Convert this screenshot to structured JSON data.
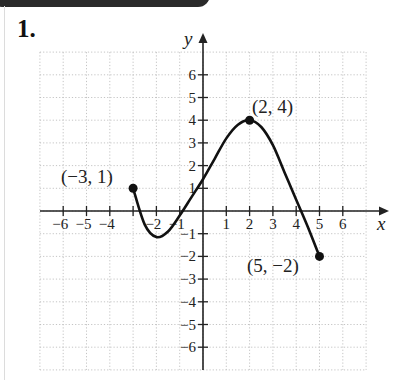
{
  "header": {
    "problem_number": "1."
  },
  "chart_data": {
    "type": "line",
    "title": "",
    "xlabel": "x",
    "ylabel": "y",
    "xlim": [
      -7,
      7
    ],
    "ylim": [
      -7,
      7
    ],
    "grid": true,
    "x_ticks": [
      -6,
      -5,
      -4,
      -3,
      -2,
      -1,
      1,
      2,
      3,
      4,
      5,
      6
    ],
    "x_tick_labels": [
      "−6",
      "−5",
      "−4",
      "",
      "−2",
      "−1",
      "1",
      "2",
      "3",
      "4",
      "5",
      "6"
    ],
    "y_ticks": [
      6,
      5,
      4,
      3,
      2,
      1,
      -1,
      -2,
      -3,
      -4,
      -5,
      -6
    ],
    "y_tick_labels": [
      "6",
      "5",
      "4",
      "3",
      "2",
      "1",
      "−1",
      "−2",
      "−3",
      "−4",
      "−5",
      "−6"
    ],
    "series": [
      {
        "name": "f(x)",
        "x": [
          -3,
          -2.5,
          -2,
          -1.5,
          -1,
          -0.5,
          0,
          0.5,
          1,
          1.5,
          2,
          2.5,
          3,
          3.5,
          4,
          4.5,
          5
        ],
        "y": [
          1,
          -0.6,
          -1.15,
          -0.9,
          -0.2,
          0.6,
          1.4,
          2.3,
          3.2,
          3.8,
          4,
          3.7,
          2.9,
          1.7,
          0.5,
          -0.7,
          -2
        ]
      }
    ],
    "annotations": [
      {
        "point": [
          -3,
          1
        ],
        "label": "(−3, 1)"
      },
      {
        "point": [
          2,
          4
        ],
        "label": "(2, 4)"
      },
      {
        "point": [
          5,
          -2
        ],
        "label": "(5, −2)"
      }
    ]
  },
  "labels": {
    "x_axis": "x",
    "y_axis": "y",
    "pt_start": "(−3, 1)",
    "pt_max": "(2, 4)",
    "pt_end": "(5, −2)"
  }
}
